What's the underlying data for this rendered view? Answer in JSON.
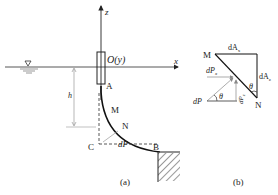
{
  "figure_a": {
    "axis_z": "z",
    "axis_x": "x",
    "origin_label": "O(y)",
    "point_A": "A",
    "point_M": "M",
    "point_N": "N",
    "point_B": "B",
    "point_C": "C",
    "depth_label": "h",
    "force_label": "dP",
    "force_sub": "z",
    "caption": "(a)",
    "water_symbol": "water-surface-triangle"
  },
  "figure_b": {
    "point_M": "M",
    "point_N": "N",
    "dAx_label": "dA",
    "dAx_sub": "x",
    "dAz_label": "dA",
    "dAz_sub": "z",
    "dPx_label": "dP",
    "dPx_sub": "x",
    "dP_label": "dP",
    "dPz_label": "dP",
    "dPz_sub": "z",
    "theta_1": "θ",
    "theta_2": "θ",
    "caption": "(b)"
  }
}
